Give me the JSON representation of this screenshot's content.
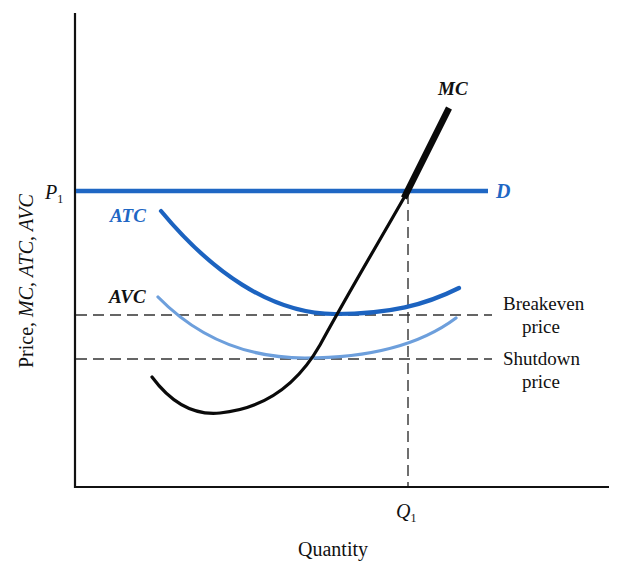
{
  "colors": {
    "axis": "#111111",
    "demand": "#1f67c4",
    "atc": "#1c63c0",
    "avc": "#6d9fdc",
    "mc": "#0a0a0a",
    "dashed": "#333333",
    "label_blue": "#1f67c4"
  },
  "axes": {
    "y_label": "Price, MC, ATC, AVC",
    "x_label": "Quantity",
    "p1_label": "P",
    "p1_sub": "1",
    "q1_label": "Q",
    "q1_sub": "1"
  },
  "curves": {
    "mc_label": "MC",
    "demand_label": "D",
    "atc_label": "ATC",
    "avc_label": "AVC"
  },
  "reference_lines": {
    "breakeven_line1": "Breakeven",
    "breakeven_line2": "price",
    "shutdown_line1": "Shutdown",
    "shutdown_line2": "price"
  },
  "chart_data": {
    "type": "line",
    "title": "",
    "xlabel": "Quantity",
    "ylabel": "Price, MC, ATC, AVC",
    "grid": false,
    "annotations": [
      "P1",
      "Q1",
      "D",
      "MC",
      "ATC",
      "AVC",
      "Breakeven price",
      "Shutdown price"
    ],
    "series": [
      {
        "name": "D",
        "shape": "horizontal line at P1",
        "points": [
          [
            0,
            0.7
          ],
          [
            0.78,
            0.7
          ]
        ]
      },
      {
        "name": "MC",
        "shape": "U-shaped, steeply rising",
        "points": [
          [
            0.15,
            0.23
          ],
          [
            0.26,
            0.15
          ],
          [
            0.44,
            0.27
          ],
          [
            0.5,
            0.37
          ],
          [
            0.63,
            0.7
          ],
          [
            0.7,
            0.86
          ]
        ]
      },
      {
        "name": "ATC",
        "shape": "U-shaped",
        "points": [
          [
            0.16,
            0.65
          ],
          [
            0.5,
            0.37
          ],
          [
            0.72,
            0.42
          ]
        ]
      },
      {
        "name": "AVC",
        "shape": "U-shaped",
        "points": [
          [
            0.16,
            0.46
          ],
          [
            0.44,
            0.27
          ],
          [
            0.72,
            0.35
          ]
        ]
      }
    ],
    "reference_lines": [
      {
        "name": "Breakeven price",
        "y": 0.37,
        "note": "minimum of ATC"
      },
      {
        "name": "Shutdown price",
        "y": 0.27,
        "note": "minimum of AVC"
      },
      {
        "name": "Q1",
        "x": 0.62,
        "note": "MC = P1"
      }
    ]
  }
}
